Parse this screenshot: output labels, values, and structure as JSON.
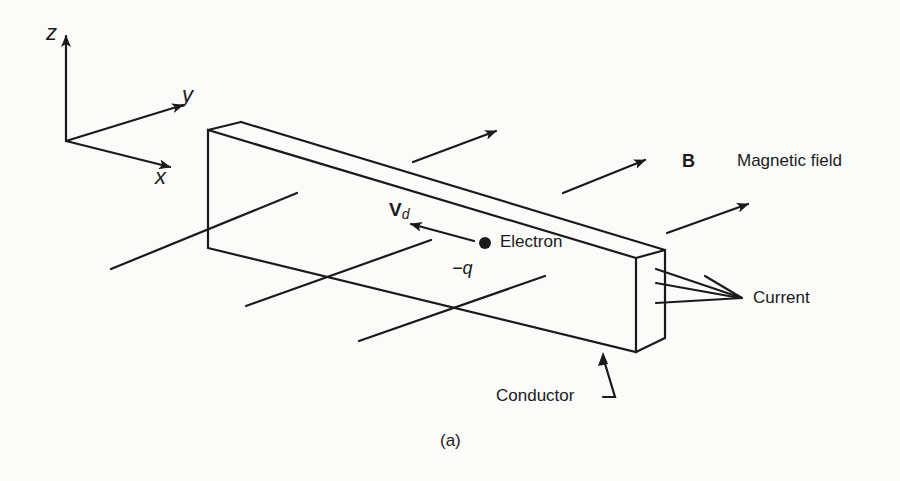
{
  "figure": {
    "caption": "(a)",
    "axes": {
      "z": "z",
      "y": "y",
      "x": "x"
    },
    "labels": {
      "magnetic_field_symbol": "B",
      "magnetic_field": "Magnetic field",
      "drift_velocity": "V",
      "drift_velocity_sub": "d",
      "electron": "Electron",
      "charge": "−q",
      "current": "Current",
      "conductor": "Conductor"
    },
    "colors": {
      "ink": "#1a1a1a",
      "background": "#fbfbfa"
    }
  }
}
